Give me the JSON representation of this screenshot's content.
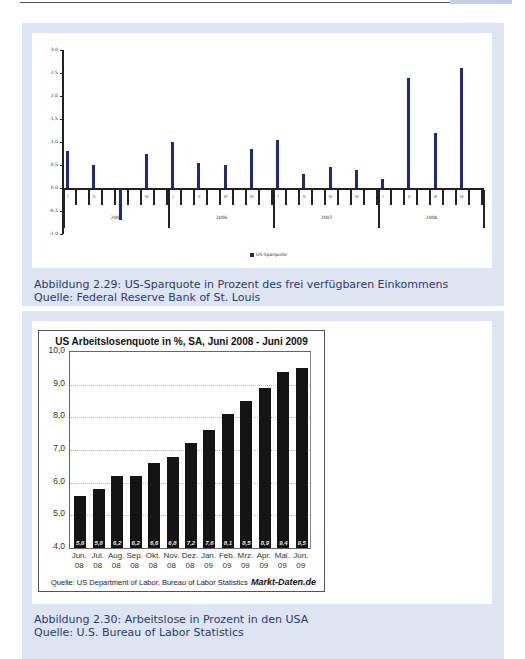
{
  "page": {
    "figure_1": {
      "caption_line1": "Abbildung 2.29:  US-Sparquote in Prozent des frei verfügbaren Einkommens",
      "caption_line2": "Quelle: Federal Reserve Bank of St. Louis"
    },
    "figure_2": {
      "caption_line1": "Abbildung 2.30:  Arbeitslose in Prozent in den USA",
      "caption_line2": "Quelle: U.S. Bureau of Labor Statistics"
    }
  },
  "chart_data": [
    {
      "type": "bar",
      "title": "",
      "xlabel": "",
      "ylabel": "",
      "ylim": [
        -1.0,
        3.0
      ],
      "yticks": [
        "3,0",
        "2,5",
        "2,0",
        "1,5",
        "1,0",
        "0,5",
        "0,0",
        "-0,5",
        "-1,0"
      ],
      "years": [
        "2005",
        "2006",
        "2007",
        "2008"
      ],
      "quarters": [
        "I",
        "II",
        "III",
        "IV"
      ],
      "categories": [
        "2005 I",
        "2005 II",
        "2005 III",
        "2005 IV",
        "2006 I",
        "2006 II",
        "2006 III",
        "2006 IV",
        "2007 I",
        "2007 II",
        "2007 III",
        "2007 IV",
        "2008 I",
        "2008 II",
        "2008 III",
        "2008 IV"
      ],
      "series": [
        {
          "name": "US-Sparquote",
          "color": "#1f2a7a",
          "values": [
            0.8,
            0.5,
            -0.7,
            0.75,
            1.0,
            0.55,
            0.5,
            0.85,
            1.05,
            0.3,
            0.45,
            0.4,
            0.2,
            2.4,
            1.2,
            2.6
          ]
        }
      ],
      "legend": "US-Sparquote",
      "legend_position": "bottom",
      "grid": false
    },
    {
      "type": "bar",
      "title": "US Arbeitslosenquote in %, SA, Juni 2008 - Juni 2009",
      "xlabel": "",
      "ylabel": "",
      "ylim": [
        4.0,
        10.0
      ],
      "yticks": [
        "10,0",
        "9,0",
        "8,0",
        "7,0",
        "6,0",
        "5,0",
        "4,0"
      ],
      "categories": [
        "Jun. 08",
        "Jul. 08",
        "Aug. 08",
        "Sep. 08",
        "Okt. 08",
        "Nov. 08",
        "Dez. 08",
        "Jan. 09",
        "Feb. 09",
        "Mrz. 09",
        "Apr. 09",
        "Mai. 09",
        "Jun. 09"
      ],
      "category_lines": [
        [
          "Jun.",
          "08"
        ],
        [
          "Jul.",
          "08"
        ],
        [
          "Aug.",
          "08"
        ],
        [
          "Sep.",
          "08"
        ],
        [
          "Okt.",
          "08"
        ],
        [
          "Nov.",
          "08"
        ],
        [
          "Dez.",
          "08"
        ],
        [
          "Jan.",
          "09"
        ],
        [
          "Feb.",
          "09"
        ],
        [
          "Mrz.",
          "09"
        ],
        [
          "Apr.",
          "09"
        ],
        [
          "Mai.",
          "09"
        ],
        [
          "Jun.",
          "09"
        ]
      ],
      "values": [
        5.6,
        5.8,
        6.2,
        6.2,
        6.6,
        6.8,
        7.2,
        7.6,
        8.1,
        8.5,
        8.9,
        9.4,
        9.5
      ],
      "value_labels": [
        "5,6",
        "5,8",
        "6,2",
        "6,2",
        "6,6",
        "6,8",
        "7,2",
        "7,6",
        "8,1",
        "8,5",
        "8,9",
        "9,4",
        "9,5"
      ],
      "color": "#141414",
      "grid": true,
      "source": "Quelle: US Department of Labor, Bureau of Labor Statistics",
      "brand": "Markt-Daten.de"
    }
  ]
}
